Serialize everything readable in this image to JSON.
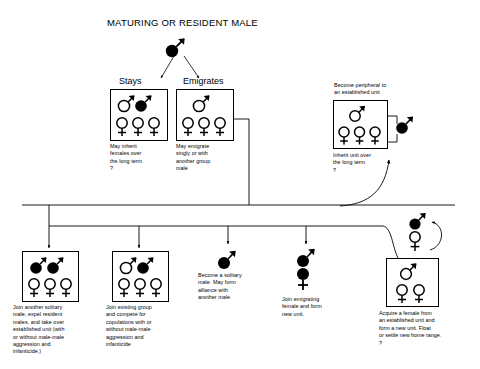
{
  "diagram": {
    "title": "MATURING OR RESIDENT MALE",
    "background": "#ffffff",
    "ink": "#000000",
    "type": "flow-diagram"
  },
  "root": {
    "label": "MATURING OR RESIDENT MALE",
    "symbol": "filled-male"
  },
  "branches": {
    "stays": {
      "label": "Stays"
    },
    "emigrates": {
      "label": "Emigrates"
    }
  },
  "nodes": [
    {
      "id": "stays-unit",
      "heading": "Stays",
      "caption": "May inherit\nfemales over\nthe long term\n?",
      "caption_lines": [
        "May inherit",
        "females over",
        "the long term",
        "?"
      ],
      "males": [
        "hollow",
        "filled"
      ],
      "females": [
        "hollow",
        "hollow",
        "hollow"
      ]
    },
    {
      "id": "emigrates-unit",
      "heading": "Emigrates",
      "caption_lines": [
        "May emigrate",
        "singly or with",
        "another group",
        "male"
      ],
      "males": [
        "hollow"
      ],
      "females": [
        "hollow",
        "hollow",
        "hollow"
      ]
    },
    {
      "id": "peripheral-unit",
      "heading_lines": [
        "Become peripheral to",
        "an established unit"
      ],
      "caption_lines": [
        "Inherit unit over",
        "the long term",
        "?"
      ],
      "males": [
        "hollow"
      ],
      "females": [
        "hollow",
        "hollow",
        "hollow"
      ],
      "outside_symbol": "filled-male"
    },
    {
      "id": "takeover-unit",
      "caption_lines": [
        "Join another solitary",
        "male, expel resident",
        "males, and take over",
        "established unit (with",
        "or without male-male",
        "aggression and",
        "infanticide.)"
      ],
      "males": [
        "filled",
        "filled"
      ],
      "females": [
        "hollow",
        "hollow",
        "hollow"
      ]
    },
    {
      "id": "join-group-unit",
      "caption_lines": [
        "Join existing group",
        "and compete for",
        "copulations with or",
        "without male-male",
        "aggression and",
        "infanticide"
      ],
      "males": [
        "hollow",
        "filled"
      ],
      "females": [
        "hollow",
        "hollow",
        "hollow"
      ]
    },
    {
      "id": "solitary-male",
      "caption_lines": [
        "Become a solitary",
        "male. May form",
        "alliance with",
        "another male."
      ],
      "males": [
        "filled"
      ],
      "females": []
    },
    {
      "id": "new-pair-unit",
      "caption_lines": [
        "Join emigrating",
        "female and form",
        "new unit."
      ],
      "males": [
        "filled"
      ],
      "females": [
        "filled"
      ]
    },
    {
      "id": "acquire-female-unit",
      "caption_lines": [
        "Acquire a female from",
        "an established unit and",
        "form a new unit.  Float",
        "or settle new home range.",
        "?"
      ],
      "males": [
        "hollow"
      ],
      "females": [
        "hollow",
        "hollow"
      ],
      "above_symbols": [
        "filled-male",
        "hollow-female"
      ]
    }
  ],
  "symbols": {
    "male": "male-symbol",
    "female": "female-symbol",
    "filled": "filled-circle",
    "hollow": "hollow-circle"
  }
}
